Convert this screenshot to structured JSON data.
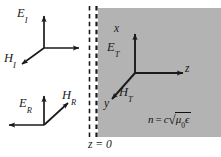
{
  "figure": {
    "type": "physics-vector-diagram",
    "background_color": "#ffffff",
    "medium_fill_color": "#b3b3b3",
    "stroke_color": "#1a1a1a",
    "boundary": {
      "label": "z = 0",
      "line_style": "dashed",
      "line_count": 2,
      "x_positions": [
        89,
        96
      ]
    },
    "regions": {
      "left": {
        "name": "vacuum-region",
        "fill": "#ffffff"
      },
      "right": {
        "name": "dielectric-medium-region",
        "fill": "#b3b3b3",
        "index_formula_text": "n = c",
        "index_formula_radicand_mu": "μ",
        "index_formula_radicand_mu_sub": "0",
        "index_formula_radicand_eps": "ϵ",
        "index_formula_c": "c",
        "index_formula_n": "n",
        "index_formula_equals": "="
      }
    },
    "waves": [
      {
        "name": "incident-wave",
        "E_label": "E",
        "E_sub": "I",
        "H_label": "H",
        "H_sub": "I",
        "propagation": "right"
      },
      {
        "name": "reflected-wave",
        "E_label": "E",
        "E_sub": "R",
        "H_label": "H",
        "H_sub": "R",
        "propagation": "left"
      },
      {
        "name": "transmitted-wave",
        "E_label": "E",
        "E_sub": "T",
        "H_label": "H",
        "H_sub": "T",
        "propagation": "right"
      }
    ],
    "axes": {
      "x_label": "x",
      "y_label": "y",
      "z_label": "z"
    }
  }
}
